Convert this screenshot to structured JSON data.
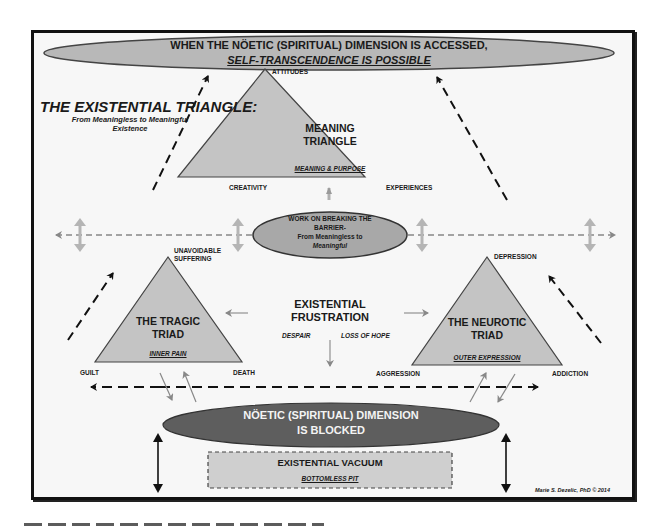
{
  "top_banner": {
    "line1": "WHEN THE NÖETIC (SPIRITUAL) DIMENSION IS ACCESSED,",
    "line2": "SELF-TRANSCENDENCE IS POSSIBLE"
  },
  "title": {
    "heading": "THE EXISTENTIAL TRIANGLE:",
    "subtitle_line1": "From Meaningless to Meaningful",
    "subtitle_line2": "Existence"
  },
  "meaning_triangle": {
    "title_line1": "MEANING",
    "title_line2": "TRIANGLE",
    "subtitle": "MEANING & PURPOSE",
    "top": "ATTITUDES",
    "left": "CREATIVITY",
    "right": "EXPERIENCES"
  },
  "barrier": {
    "line1": "WORK ON BREAKING THE",
    "line2": "BARRIER-",
    "line3": "From Meaningless to",
    "line4": "Meaningful"
  },
  "tragic_triad": {
    "title_line1": "THE TRAGIC",
    "title_line2": "TRIAD",
    "subtitle": "INNER PAIN",
    "top_line1": "UNAVOIDABLE",
    "top_line2": "SUFFERING",
    "left": "GUILT",
    "right": "DEATH"
  },
  "frustration": {
    "line1": "EXISTENTIAL",
    "line2": "FRUSTRATION",
    "left": "DESPAIR",
    "right": "LOSS OF HOPE"
  },
  "neurotic_triad": {
    "title_line1": "THE NEUROTIC",
    "title_line2": "TRIAD",
    "subtitle": "OUTER EXPRESSION",
    "top": "DEPRESSION",
    "left": "AGGRESSION",
    "right": "ADDICTION"
  },
  "blocked": {
    "line1": "NÖETIC (SPIRITUAL) DIMENSION",
    "line2": "IS BLOCKED"
  },
  "vacuum": {
    "title": "EXISTENTIAL VACUUM",
    "subtitle": "BOTTOMLESS PIT"
  },
  "credit": "Marie S. Dezelic, PhD © 2014",
  "colors": {
    "triangle_fill": "#c4c4c4",
    "top_ellipse_fill": "#b8b8b8",
    "barrier_ellipse_fill": "#a8a8a8",
    "blocked_ellipse_fill": "#5e5e5e",
    "vacuum_fill": "#cfcfcf",
    "gray_arrow": "#a0a0a0",
    "frame": "#111111"
  }
}
